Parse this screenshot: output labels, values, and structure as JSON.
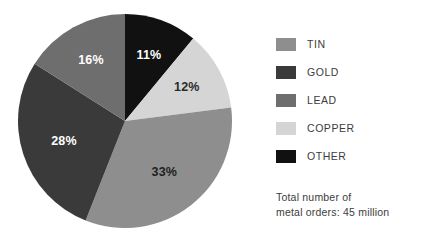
{
  "chart_data": {
    "type": "pie",
    "title": "",
    "categories": [
      "OTHER",
      "COPPER",
      "TIN",
      "GOLD",
      "LEAD"
    ],
    "values": [
      11,
      12,
      33,
      28,
      16
    ],
    "value_labels": [
      "11%",
      "12%",
      "33%",
      "28%",
      "16%"
    ],
    "unit": "%",
    "start_angle_deg": 0,
    "direction": "clockwise",
    "legend_position": "right",
    "grid": false,
    "slices": [
      {
        "name": "OTHER",
        "value": 11,
        "label": "11%",
        "color": "#111111",
        "label_color": "#ffffff"
      },
      {
        "name": "COPPER",
        "value": 12,
        "label": "12%",
        "color": "#d5d5d5",
        "label_color": "#2b2b2b"
      },
      {
        "name": "TIN",
        "value": 33,
        "label": "33%",
        "color": "#8e8e8e",
        "label_color": "#1f1f1f"
      },
      {
        "name": "GOLD",
        "value": 28,
        "label": "28%",
        "color": "#3a3a3a",
        "label_color": "#ffffff"
      },
      {
        "name": "LEAD",
        "value": 16,
        "label": "16%",
        "color": "#6e6e6e",
        "label_color": "#ffffff"
      }
    ]
  },
  "legend": {
    "items": [
      {
        "label": "TIN",
        "color": "#8e8e8e"
      },
      {
        "label": "GOLD",
        "color": "#3a3a3a"
      },
      {
        "label": "LEAD",
        "color": "#6e6e6e"
      },
      {
        "label": "COPPER",
        "color": "#d5d5d5"
      },
      {
        "label": "OTHER",
        "color": "#111111"
      }
    ]
  },
  "caption": {
    "line1": "Total number of",
    "line2": "metal orders: 45 million"
  },
  "colors": {
    "background": "#ffffff",
    "text": "#3c3c3c"
  }
}
